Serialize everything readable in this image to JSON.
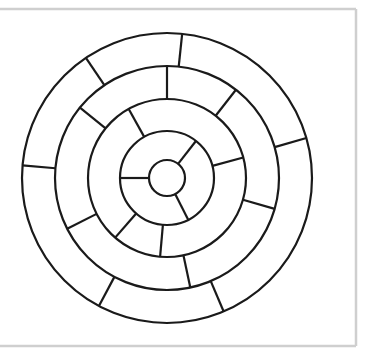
{
  "diagram": {
    "canvas": {
      "width": 374,
      "height": 355,
      "background": "#ffffff"
    },
    "frame": {
      "top_y": 9,
      "right_x": 356,
      "bottom_y": 346,
      "color": "#cfcfcf"
    },
    "center": {
      "x": 167,
      "y": 178
    },
    "stroke_color": "#1a1a1a",
    "circles_radii": [
      18,
      47,
      79,
      112,
      145
    ],
    "rings": [
      {
        "name": "ring-1",
        "inner_r": 18,
        "outer_r": 47,
        "spoke_angles_deg": [
          -52,
          63,
          180
        ]
      },
      {
        "name": "ring-2",
        "inner_r": 47,
        "outer_r": 79,
        "spoke_angles_deg": [
          -119,
          -15,
          95,
          131
        ]
      },
      {
        "name": "ring-3",
        "inner_r": 79,
        "outer_r": 112,
        "spoke_angles_deg": [
          -141,
          -90,
          -52,
          16,
          78,
          153
        ]
      },
      {
        "name": "ring-4",
        "inner_r": 112,
        "outer_r": 145,
        "spoke_angles_deg": [
          -175,
          -124,
          -84,
          -16,
          67,
          118
        ]
      }
    ]
  }
}
